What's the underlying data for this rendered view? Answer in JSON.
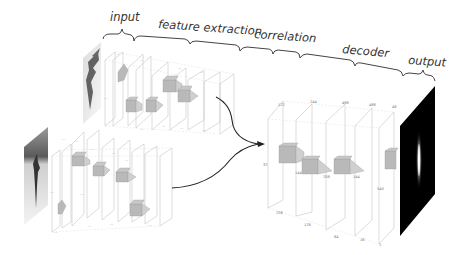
{
  "stages": {
    "input": "input",
    "feature_extraction": "feature extraction",
    "correlation": "correlation",
    "decoder": "decoder",
    "output": "output"
  },
  "branches": {
    "template_branch": {
      "description": "upper feature extraction branch (template image)",
      "input_image": "grayscale target crop"
    },
    "search_branch": {
      "description": "lower feature extraction branch (search image)",
      "input_image": "grayscale search region"
    }
  },
  "decoder": {
    "top_labels": [
      "122",
      "244",
      "488",
      "488",
      "48"
    ],
    "side_label": "32",
    "bottom_labels": [
      "256",
      "128",
      "64",
      "16",
      "1"
    ],
    "kernel_labels": [
      "144",
      "208",
      "144",
      "540"
    ]
  },
  "output": {
    "description": "black response map with vertical bright peak"
  },
  "colors": {
    "text": "#333333",
    "layer_outline": "#b8b8b8",
    "kernel_fill": "#b9b9b9",
    "output_bg": "#000000"
  }
}
